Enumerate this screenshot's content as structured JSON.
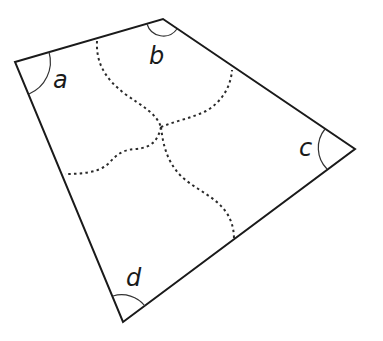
{
  "diagram": {
    "type": "quadrilateral-with-angle-labels",
    "colors": {
      "background": "#ffffff",
      "edge": "#1a1a1a",
      "arc": "#333333",
      "dashed": "#2a2a2a",
      "label": "#1a1a1a"
    },
    "vertices": {
      "a": {
        "x": 15,
        "y": 62
      },
      "b": {
        "x": 163,
        "y": 19
      },
      "c": {
        "x": 355,
        "y": 149
      },
      "d": {
        "x": 123,
        "y": 322
      }
    },
    "angle_labels": {
      "a": "a",
      "b": "b",
      "c": "c",
      "d": "d"
    },
    "dashed_cut_lines": [
      {
        "name": "cut-ab-to-center",
        "from_edge": "ab",
        "to": "center"
      },
      {
        "name": "cut-bc-to-center",
        "from_edge": "bc",
        "to": "center"
      },
      {
        "name": "cut-ad-to-center",
        "from_edge": "ad",
        "to": "center"
      },
      {
        "name": "cut-cd-to-center",
        "from_edge": "cd",
        "to": "center"
      }
    ],
    "center_point": {
      "x": 161,
      "y": 127
    }
  }
}
